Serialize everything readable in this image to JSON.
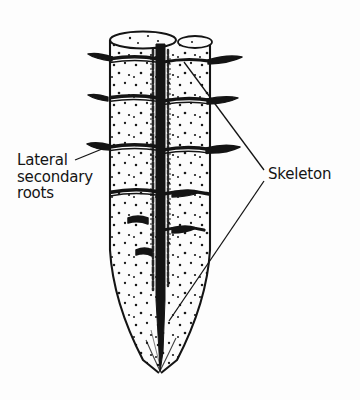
{
  "figure": {
    "kind": "scientific-line-drawing",
    "background_color": "#fdfdfd",
    "ink_color": "#141414",
    "labels": [
      {
        "id": "lateral-secondary-roots",
        "lines": [
          "Lateral",
          "secondary",
          "roots"
        ],
        "text": "Lateral\nsecondary\nroots",
        "x": 17,
        "y": 152,
        "leader_target": "lateral root stub on left side of root body"
      },
      {
        "id": "skeleton",
        "lines": [
          "Skeleton"
        ],
        "text": "Skeleton",
        "x": 268,
        "y": 166,
        "leader_target": "dark central skeletal axis, upper and lower"
      }
    ],
    "leader_lines": [
      {
        "id": "leader-lateral",
        "from": [
          75,
          160
        ],
        "to": [
          106,
          147
        ]
      },
      {
        "id": "leader-skeleton-upper",
        "from": [
          264,
          170
        ],
        "to": [
          185,
          62
        ]
      },
      {
        "id": "leader-skeleton-lower",
        "from": [
          264,
          180
        ],
        "to": [
          170,
          320
        ]
      }
    ],
    "root_body": {
      "top_ellipse": {
        "cx": 143,
        "cy": 40,
        "rx": 33,
        "ry": 8
      },
      "tip_point": [
        160,
        373
      ],
      "left_edge_x": 108,
      "right_edge_x": 212,
      "segment_band_y": [
        62,
        97,
        140,
        186
      ],
      "lateral_stubs": [
        {
          "side": "left",
          "y": 58
        },
        {
          "side": "right",
          "y": 62
        },
        {
          "side": "left",
          "y": 97
        },
        {
          "side": "right",
          "y": 101
        },
        {
          "side": "left",
          "y": 148
        },
        {
          "side": "right",
          "y": 150
        },
        {
          "side": "right",
          "y": 192
        },
        {
          "side": "left",
          "y": 218
        },
        {
          "side": "right",
          "y": 228
        },
        {
          "side": "left",
          "y": 252
        }
      ],
      "skeleton_axis": {
        "x": 160,
        "top_y": 44,
        "bottom_y": 368
      }
    }
  }
}
